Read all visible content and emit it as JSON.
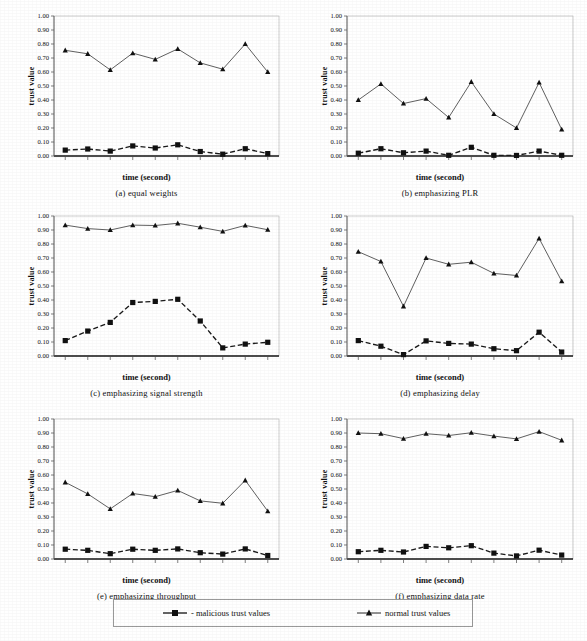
{
  "figure": {
    "x_axis_label": "time (second)",
    "y_axis_label": "trust value",
    "tick_labels_y": [
      "1.00",
      "0.90",
      "0.80",
      "0.70",
      "0.60",
      "0.50",
      "0.40",
      "0.30",
      "0.20",
      "0.10",
      "0.00"
    ],
    "tick_labels_x": [
      "1",
      "2",
      "3",
      "4",
      "5",
      "6",
      "7",
      "8",
      "9",
      "10"
    ]
  },
  "legend": {
    "malicious_label": "- malicious trust values",
    "normal_label": "normal trust values",
    "malicious_marker": "square-marker-icon",
    "normal_marker": "triangle-marker-icon"
  },
  "captions": {
    "a": "(a)  equal weights",
    "b": "(b)  emphasizing PLR",
    "c": "(c)  emphasizing signal strength",
    "d": "(d)  emphasizing delay",
    "e": "(e)  emphasizing throughput",
    "f": "(f)  emphasizing data rate"
  },
  "chart_data": [
    {
      "id": "a",
      "type": "line",
      "title": "(a)  equal weights",
      "xlabel": "time (second)",
      "ylabel": "trust value",
      "x": [
        1,
        2,
        3,
        4,
        5,
        6,
        7,
        8,
        9,
        10
      ],
      "categories": [
        "1",
        "2",
        "3",
        "4",
        "5",
        "6",
        "7",
        "8",
        "9",
        "10"
      ],
      "ylim": [
        0.0,
        1.0
      ],
      "ytick_step": 0.1,
      "grid": false,
      "legend_position": "bottom-shared",
      "series": [
        {
          "name": "normal trust values",
          "marker": "triangle",
          "linestyle": "solid",
          "values": [
            0.755,
            0.73,
            0.615,
            0.735,
            0.69,
            0.765,
            0.665,
            0.62,
            0.8,
            0.6
          ]
        },
        {
          "name": "malicious trust values",
          "marker": "square",
          "linestyle": "dashed",
          "values": [
            0.042,
            0.05,
            0.035,
            0.072,
            0.057,
            0.08,
            0.032,
            0.013,
            0.052,
            0.017
          ]
        }
      ]
    },
    {
      "id": "b",
      "type": "line",
      "title": "(b)  emphasizing PLR",
      "xlabel": "time (second)",
      "ylabel": "trust value",
      "x": [
        1,
        2,
        3,
        4,
        5,
        6,
        7,
        8,
        9,
        10
      ],
      "categories": [
        "1",
        "2",
        "3",
        "4",
        "5",
        "6",
        "7",
        "8",
        "9",
        "10"
      ],
      "ylim": [
        0.0,
        1.0
      ],
      "ytick_step": 0.1,
      "grid": false,
      "legend_position": "bottom-shared",
      "series": [
        {
          "name": "normal trust values",
          "marker": "triangle",
          "linestyle": "solid",
          "values": [
            0.4,
            0.515,
            0.375,
            0.41,
            0.275,
            0.53,
            0.3,
            0.2,
            0.525,
            0.19
          ]
        },
        {
          "name": "malicious trust values",
          "marker": "square",
          "linestyle": "dashed",
          "values": [
            0.02,
            0.052,
            0.023,
            0.035,
            0.005,
            0.062,
            0.005,
            0.004,
            0.035,
            0.005
          ]
        }
      ]
    },
    {
      "id": "c",
      "type": "line",
      "title": "(c)  emphasizing signal strength",
      "xlabel": "time (second)",
      "ylabel": "trust value",
      "x": [
        1,
        2,
        3,
        4,
        5,
        6,
        7,
        8,
        9,
        10
      ],
      "categories": [
        "1",
        "2",
        "3",
        "4",
        "5",
        "6",
        "7",
        "8",
        "9",
        "10"
      ],
      "ylim": [
        0.0,
        1.0
      ],
      "ytick_step": 0.1,
      "grid": false,
      "legend_position": "bottom-shared",
      "series": [
        {
          "name": "normal trust values",
          "marker": "triangle",
          "linestyle": "solid",
          "values": [
            0.935,
            0.91,
            0.9,
            0.935,
            0.932,
            0.948,
            0.92,
            0.89,
            0.933,
            0.902
          ]
        },
        {
          "name": "malicious trust values",
          "marker": "square",
          "linestyle": "dashed",
          "values": [
            0.11,
            0.178,
            0.24,
            0.382,
            0.39,
            0.405,
            0.25,
            0.058,
            0.085,
            0.098
          ]
        }
      ]
    },
    {
      "id": "d",
      "type": "line",
      "title": "(d)  emphasizing delay",
      "xlabel": "time (second)",
      "ylabel": "trust value",
      "x": [
        1,
        2,
        3,
        4,
        5,
        6,
        7,
        8,
        9,
        10
      ],
      "categories": [
        "1",
        "2",
        "3",
        "4",
        "5",
        "6",
        "7",
        "8",
        "9",
        "10"
      ],
      "ylim": [
        0.0,
        1.0
      ],
      "ytick_step": 0.1,
      "grid": false,
      "legend_position": "bottom-shared",
      "series": [
        {
          "name": "normal trust values",
          "marker": "triangle",
          "linestyle": "solid",
          "values": [
            0.745,
            0.675,
            0.355,
            0.7,
            0.655,
            0.67,
            0.59,
            0.575,
            0.84,
            0.535
          ]
        },
        {
          "name": "malicious trust values",
          "marker": "square",
          "linestyle": "dashed",
          "values": [
            0.11,
            0.07,
            0.01,
            0.108,
            0.09,
            0.085,
            0.052,
            0.038,
            0.17,
            0.028
          ]
        }
      ]
    },
    {
      "id": "e",
      "type": "line",
      "title": "(e)  emphasizing throughput",
      "xlabel": "time (second)",
      "ylabel": "trust value",
      "x": [
        1,
        2,
        3,
        4,
        5,
        6,
        7,
        8,
        9,
        10
      ],
      "categories": [
        "1",
        "2",
        "3",
        "4",
        "5",
        "6",
        "7",
        "8",
        "9",
        "10"
      ],
      "ylim": [
        0.0,
        1.0
      ],
      "ytick_step": 0.1,
      "grid": false,
      "legend_position": "bottom-shared",
      "series": [
        {
          "name": "normal trust values",
          "marker": "triangle",
          "linestyle": "solid",
          "values": [
            0.548,
            0.465,
            0.358,
            0.468,
            0.445,
            0.49,
            0.415,
            0.398,
            0.562,
            0.342
          ]
        },
        {
          "name": "malicious trust values",
          "marker": "square",
          "linestyle": "dashed",
          "values": [
            0.07,
            0.062,
            0.038,
            0.07,
            0.062,
            0.072,
            0.045,
            0.035,
            0.072,
            0.025
          ]
        }
      ]
    },
    {
      "id": "f",
      "type": "line",
      "title": "(f)  emphasizing data rate",
      "xlabel": "time (second)",
      "ylabel": "trust value",
      "x": [
        1,
        2,
        3,
        4,
        5,
        6,
        7,
        8,
        9,
        10
      ],
      "categories": [
        "1",
        "2",
        "3",
        "4",
        "5",
        "6",
        "7",
        "8",
        "9",
        "10"
      ],
      "ylim": [
        0.0,
        1.0
      ],
      "ytick_step": 0.1,
      "grid": false,
      "legend_position": "bottom-shared",
      "series": [
        {
          "name": "normal trust values",
          "marker": "triangle",
          "linestyle": "solid",
          "values": [
            0.9,
            0.895,
            0.86,
            0.895,
            0.882,
            0.902,
            0.878,
            0.858,
            0.91,
            0.848
          ]
        },
        {
          "name": "malicious trust values",
          "marker": "square",
          "linestyle": "dashed",
          "values": [
            0.052,
            0.062,
            0.05,
            0.09,
            0.08,
            0.095,
            0.042,
            0.022,
            0.063,
            0.028
          ]
        }
      ]
    }
  ]
}
